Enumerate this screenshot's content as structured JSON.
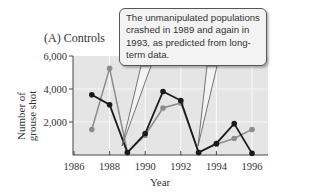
{
  "panel": {
    "title": "(A)  Controls"
  },
  "axes": {
    "ylabel_line1": "Number of",
    "ylabel_line2": "grouse shot",
    "xlabel": "Year",
    "yticks": [
      "6,000",
      "4,000",
      "2,000"
    ],
    "xticks": [
      "1986",
      "1988",
      "1990",
      "1992",
      "1994",
      "1996"
    ]
  },
  "callout": {
    "text": "The unmanipulated populations crashed in 1989 and again in 1993, as predicted from long-term data."
  },
  "colors": {
    "plot_bg": "#e5e5e5",
    "grid": "#f7f7f7",
    "series_dark": "#1a1a1a",
    "series_gray": "#8c8c8c"
  },
  "chart_data": {
    "type": "line",
    "title": "(A) Controls",
    "xlabel": "Year",
    "ylabel": "Number of grouse shot",
    "x": [
      1987,
      1988,
      1989,
      1990,
      1991,
      1992,
      1993,
      1994,
      1995,
      1996
    ],
    "series": [
      {
        "name": "Population 1 (black)",
        "color": "#1a1a1a",
        "values": [
          3650,
          3050,
          150,
          1300,
          3850,
          3300,
          150,
          700,
          1900,
          100
        ]
      },
      {
        "name": "Population 2 (gray)",
        "color": "#8c8c8c",
        "values": [
          1550,
          5250,
          150,
          1200,
          2850,
          3150,
          150,
          650,
          1000,
          1550
        ]
      }
    ],
    "xlim": [
      1986,
      1996.9
    ],
    "ylim": [
      0,
      6000
    ],
    "xtick_labels": [
      "1986",
      "1988",
      "1990",
      "1992",
      "1994",
      "1996"
    ],
    "ytick_labels": [
      "2,000",
      "4,000",
      "6,000"
    ],
    "grid": true,
    "legend": null,
    "annotations": [
      "The unmanipulated populations crashed in 1989 and again in 1993, as predicted from long-term data."
    ]
  }
}
